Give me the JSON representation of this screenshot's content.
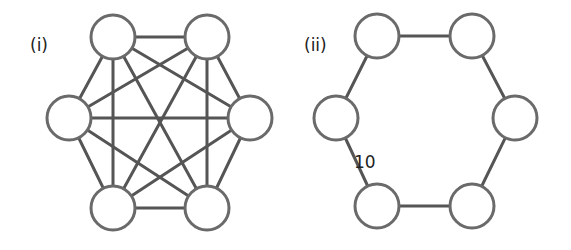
{
  "graphs": [
    {
      "id": "complete-graph",
      "label": "(i)",
      "label_pos": [
        30,
        51
      ],
      "node_radius": 22,
      "nodes": [
        {
          "id": "A",
          "x": 113,
          "y": 37
        },
        {
          "id": "B",
          "x": 207,
          "y": 37
        },
        {
          "id": "C",
          "x": 250,
          "y": 118
        },
        {
          "id": "D",
          "x": 207,
          "y": 208
        },
        {
          "id": "E",
          "x": 113,
          "y": 208
        },
        {
          "id": "F",
          "x": 69,
          "y": 118
        }
      ],
      "edges": [
        [
          "A",
          "B"
        ],
        [
          "A",
          "C"
        ],
        [
          "A",
          "D"
        ],
        [
          "A",
          "E"
        ],
        [
          "A",
          "F"
        ],
        [
          "B",
          "C"
        ],
        [
          "B",
          "D"
        ],
        [
          "B",
          "E"
        ],
        [
          "B",
          "F"
        ],
        [
          "C",
          "D"
        ],
        [
          "C",
          "E"
        ],
        [
          "C",
          "F"
        ],
        [
          "D",
          "E"
        ],
        [
          "D",
          "F"
        ],
        [
          "E",
          "F"
        ]
      ],
      "edge_labels": []
    },
    {
      "id": "cycle-graph",
      "label": "(ii)",
      "label_pos": [
        304,
        51
      ],
      "node_radius": 22,
      "nodes": [
        {
          "id": "A",
          "x": 377,
          "y": 36
        },
        {
          "id": "B",
          "x": 472,
          "y": 36
        },
        {
          "id": "C",
          "x": 515,
          "y": 118
        },
        {
          "id": "D",
          "x": 472,
          "y": 206
        },
        {
          "id": "E",
          "x": 377,
          "y": 206
        },
        {
          "id": "F",
          "x": 336,
          "y": 118
        }
      ],
      "edges": [
        [
          "A",
          "B"
        ],
        [
          "B",
          "C"
        ],
        [
          "C",
          "D"
        ],
        [
          "D",
          "E"
        ],
        [
          "E",
          "F"
        ],
        [
          "F",
          "A"
        ]
      ],
      "edge_labels": [
        {
          "edge": [
            "F",
            "E"
          ],
          "text": "10",
          "x": 354,
          "y": 168
        }
      ]
    }
  ]
}
